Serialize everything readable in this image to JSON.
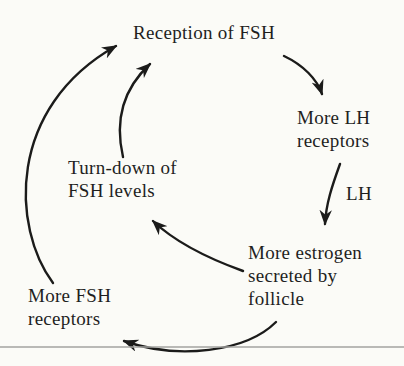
{
  "diagram": {
    "nodes": {
      "reception": {
        "label": "Reception of FSH"
      },
      "lh_receptors": {
        "lines": [
          "More LH",
          "receptors"
        ]
      },
      "estrogen": {
        "lines": [
          "More estrogen",
          "secreted by",
          "follicle"
        ]
      },
      "turndown": {
        "lines": [
          "Turn-down of",
          "FSH levels"
        ]
      },
      "fsh_receptors": {
        "lines": [
          "More FSH",
          "receptors"
        ]
      }
    },
    "edges": [
      {
        "from": "Reception of FSH",
        "to": "More LH receptors",
        "label": ""
      },
      {
        "from": "More LH receptors",
        "to": "More estrogen secreted by follicle",
        "label": "LH"
      },
      {
        "from": "More estrogen secreted by follicle",
        "to": "Turn-down of FSH levels",
        "label": ""
      },
      {
        "from": "More estrogen secreted by follicle",
        "to": "More FSH receptors",
        "label": ""
      },
      {
        "from": "More FSH receptors",
        "to": "Reception of FSH",
        "label": ""
      },
      {
        "from": "Turn-down of FSH levels",
        "to": "Reception of FSH",
        "label": ""
      }
    ]
  },
  "colors": {
    "background": "#fbfbf7",
    "text": "#1f1f1e",
    "arrow": "#1b1b1a",
    "rule_line": "#a3a3a0"
  }
}
